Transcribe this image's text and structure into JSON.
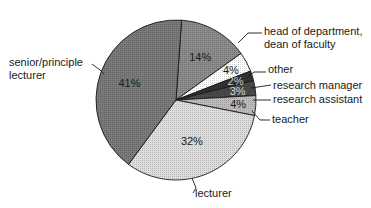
{
  "chart_data": {
    "type": "pie",
    "title": "",
    "slices": [
      {
        "label": "head of department, dean of faculty",
        "label_lines": [
          "head of department,",
          "dean of faculty"
        ],
        "value": 14,
        "pct_label": "14%",
        "fill": "#8c8c8c",
        "pct_color": "#1a1a1a"
      },
      {
        "label": "other",
        "label_lines": [
          "other"
        ],
        "value": 4,
        "pct_label": "4%",
        "fill": "#ffffff",
        "pct_color": "#1a1a1a"
      },
      {
        "label": "research manager",
        "label_lines": [
          "research manager"
        ],
        "value": 2,
        "pct_label": "2%",
        "fill": "#333333",
        "pct_color": "#cfcfcf"
      },
      {
        "label": "research assistant",
        "label_lines": [
          "research assistant"
        ],
        "value": 3,
        "pct_label": "3%",
        "fill": "#4a4a4a",
        "pct_color": "#d8d8d8"
      },
      {
        "label": "teacher",
        "label_lines": [
          "teacher"
        ],
        "value": 4,
        "pct_label": "4%",
        "fill": "#bdbdbd",
        "pct_color": "#1a1a1a"
      },
      {
        "label": "lecturer",
        "label_lines": [
          "lecturer"
        ],
        "value": 32,
        "pct_label": "32%",
        "fill": "#dedede",
        "pct_color": "#1a1a1a"
      },
      {
        "label": "senior/principle lecturer",
        "label_lines": [
          "senior/principle",
          "lecturer"
        ],
        "value": 41,
        "pct_label": "41%",
        "fill": "#7a7a7a",
        "pct_color": "#1a1a1a"
      }
    ],
    "start_angle_deg": -4,
    "direction": "clockwise",
    "legend": "none (leader-line labels)"
  }
}
